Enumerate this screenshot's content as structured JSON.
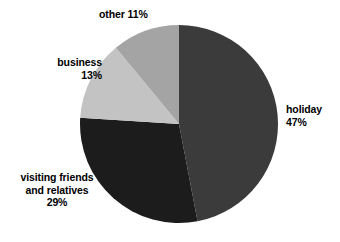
{
  "chart_data": {
    "type": "pie",
    "title": "",
    "subtitle": "",
    "xlabel": "",
    "ylabel": "",
    "legend_position": "none",
    "grid": false,
    "unit": "%",
    "start_angle_deg": 0,
    "direction": "clockwise",
    "categories": [
      "holiday",
      "visiting friends and relatives",
      "business",
      "other"
    ],
    "values": [
      47,
      29,
      13,
      11
    ],
    "slices": [
      {
        "label": "holiday",
        "label_lines": [
          "holiday",
          "47%"
        ],
        "value": 47,
        "value_text": "47%",
        "color": "#3b3b3b",
        "start_deg": 0,
        "end_deg": 169.2
      },
      {
        "label": "visiting friends and relatives",
        "label_lines": [
          "visiting friends",
          "and relatives",
          "29%"
        ],
        "value": 29,
        "value_text": "29%",
        "color": "#1c1c1c",
        "start_deg": 169.2,
        "end_deg": 273.6
      },
      {
        "label": "business",
        "label_lines": [
          "business",
          "13%"
        ],
        "value": 13,
        "value_text": "13%",
        "color": "#c3c3c3",
        "start_deg": 273.6,
        "end_deg": 320.4
      },
      {
        "label": "other",
        "label_lines": [
          "other 11%"
        ],
        "value": 11,
        "value_text": "11%",
        "color": "#a4a4a4",
        "start_deg": 320.4,
        "end_deg": 360
      }
    ]
  },
  "labels": {
    "holiday": {
      "line1": "holiday",
      "line2": "47%"
    },
    "other": {
      "line1": "other 11%"
    },
    "business": {
      "line1": "business",
      "line2": "13%"
    },
    "visiting": {
      "line1": "visiting friends",
      "line2": "and relatives",
      "line3": "29%"
    }
  },
  "colors": {
    "background": "#ffffff",
    "text": "#000000",
    "holiday": "#3b3b3b",
    "visiting": "#1c1c1c",
    "business": "#c3c3c3",
    "other": "#a4a4a4"
  }
}
